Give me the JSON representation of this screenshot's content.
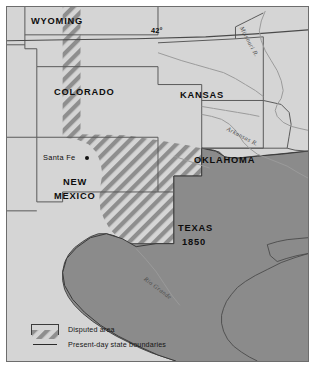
{
  "map": {
    "title": "Texas 1850 and the Disputed Area",
    "colors": {
      "land": "#d5d5d5",
      "texas_fill": "#8b8b8b",
      "water": "#ffffff",
      "boundary": "#6d6d6d",
      "state_boundary": "#5a5a5a",
      "hatch": "#8e8e8e",
      "frame": "#6d6d6d",
      "text": "#0d0d0d",
      "river": "#8d8d8d"
    },
    "states": [
      {
        "name": "WYOMING",
        "x": 30,
        "y": 15
      },
      {
        "name": "COLORADO",
        "x": 53,
        "y": 86
      },
      {
        "name": "KANSAS",
        "x": 179,
        "y": 89
      },
      {
        "name": "OKLAHOMA",
        "x": 193,
        "y": 154
      },
      {
        "name": "NEW",
        "x": 60,
        "y": 176
      },
      {
        "name": "MEXICO",
        "x": 51,
        "y": 190
      }
    ],
    "territory": {
      "name": "TEXAS",
      "year": "1850",
      "label_x": 177,
      "label_y": 222
    },
    "cities": [
      {
        "name": "Santa Fe",
        "label_x": 42,
        "label_y": 152,
        "dot_x": 84,
        "dot_y": 157
      }
    ],
    "parallels": [
      {
        "label": "42°",
        "x": 150,
        "y": 25
      }
    ],
    "rivers": [
      {
        "name": "Missouri R.",
        "x": 256,
        "y": 26,
        "rotate": 62
      },
      {
        "name": "Arkansas R.",
        "x": 239,
        "y": 128,
        "rotate": 27
      },
      {
        "name": "Rio Grande",
        "x": 153,
        "y": 279,
        "rotate": 37
      }
    ],
    "legend": {
      "items": [
        {
          "key": "hatch-swatch",
          "label": "Disputed area"
        },
        {
          "key": "line-swatch",
          "label": "Present-day state boundaries"
        }
      ]
    }
  }
}
